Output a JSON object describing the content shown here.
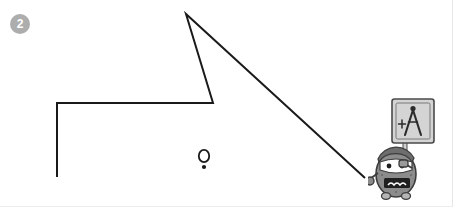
{
  "canvas": {
    "width": 453,
    "height": 207,
    "background": "#ffffff",
    "border_color": "#e6e6e6"
  },
  "step_badge": {
    "label": "2",
    "fill": "#adadad",
    "text_color": "#ffffff"
  },
  "drawing": {
    "stroke_color": "#1a1a1a",
    "stroke_width": 2,
    "polyline_label": "geometry-polyline",
    "vertices": [
      {
        "x": 57,
        "y": 177
      },
      {
        "x": 57,
        "y": 103
      },
      {
        "x": 213,
        "y": 103
      },
      {
        "x": 186,
        "y": 14
      },
      {
        "x": 365,
        "y": 178
      }
    ],
    "point_marker": {
      "label": "point-marker",
      "circle": {
        "cx": 204,
        "cy": 156,
        "rx": 5.2,
        "ry": 6.2
      },
      "dot": {
        "cx": 204,
        "cy": 167,
        "r": 2.1
      }
    }
  },
  "mascot": {
    "name": "compass-mascot",
    "body_fill": "#8c8c8c",
    "body_stroke": "#3d3d3d",
    "face_fill": "#ffffff",
    "sign_fill": "#d4d4d4",
    "sign_stroke": "#4a4a4a",
    "pole_fill": "#cfcfcf",
    "icon_name": "drafting-compass-icon",
    "icon_color": "#2b2b2b",
    "hat_fill": "#6e6e6e",
    "mouth_fill": "#1f1f1f",
    "mouth_text": "≈≈"
  }
}
